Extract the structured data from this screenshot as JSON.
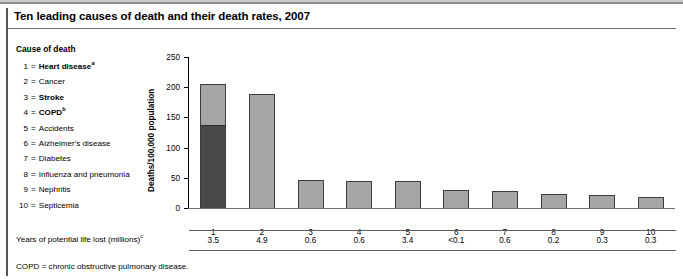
{
  "title": "Ten leading causes of death and their death rates, 2007",
  "legend": {
    "heading": "Cause of death",
    "items": [
      {
        "num": "1",
        "eq": "=",
        "label": "Heart disease",
        "sup": "a",
        "bold": true
      },
      {
        "num": "2",
        "eq": "=",
        "label": "Cancer",
        "sup": "",
        "bold": false
      },
      {
        "num": "3",
        "eq": "=",
        "label": "Stroke",
        "sup": "",
        "bold": true
      },
      {
        "num": "4",
        "eq": "=",
        "label": "COPD",
        "sup": "b",
        "bold": true
      },
      {
        "num": "5",
        "eq": "=",
        "label": "Accidents",
        "sup": "",
        "bold": false
      },
      {
        "num": "6",
        "eq": "=",
        "label": "Alzheimer's disease",
        "sup": "",
        "bold": false
      },
      {
        "num": "7",
        "eq": "=",
        "label": "Diabetes",
        "sup": "",
        "bold": false
      },
      {
        "num": "8",
        "eq": "=",
        "label": "Influenza and pneumonia",
        "sup": "",
        "bold": false
      },
      {
        "num": "9",
        "eq": "=",
        "label": "Nephritis",
        "sup": "",
        "bold": false
      },
      {
        "num": "10",
        "eq": "=",
        "label": "Septicemia",
        "sup": "",
        "bold": false
      }
    ]
  },
  "table": {
    "row_label": "Years of potential life lost (millions)",
    "row_label_sup": "c",
    "values": [
      "3.5",
      "4.9",
      "0.6",
      "0.6",
      "3.4",
      "<0.1",
      "0.6",
      "0.2",
      "0.3",
      "0.3"
    ]
  },
  "footnote": "COPD = chronic obstructive pulmonary disease.",
  "colors": {
    "bar_light": "#a6a6a6",
    "bar_dark": "#4a4a4a",
    "bar_outline": "#3d3d3d",
    "axis": "#000000",
    "rule": "#5e5e5e"
  },
  "chart_data": {
    "type": "bar",
    "title": "Ten leading causes of death and their death rates, 2007",
    "xlabel": "",
    "ylabel": "Deaths/100,000 population",
    "ylim": [
      0,
      250
    ],
    "yticks": [
      0,
      50,
      100,
      150,
      200,
      250
    ],
    "ytick_labels": [
      "0",
      "50",
      "100",
      "150",
      "200",
      "250"
    ],
    "grid": false,
    "legend_position": "left-outside",
    "categories": [
      "1",
      "2",
      "3",
      "4",
      "5",
      "6",
      "7",
      "8",
      "9",
      "10"
    ],
    "category_names": [
      "Heart disease",
      "Cancer",
      "Stroke",
      "COPD",
      "Accidents",
      "Alzheimer's disease",
      "Diabetes",
      "Influenza and pneumonia",
      "Nephritis",
      "Septicemia"
    ],
    "values": [
      205,
      189,
      46,
      45,
      44,
      29,
      28,
      23,
      22,
      19
    ],
    "stacked": true,
    "series": [
      {
        "name": "Lower segment (dark)",
        "color": "#4a4a4a",
        "values": [
          137,
          0,
          0,
          0,
          0,
          0,
          0,
          0,
          0,
          0
        ]
      },
      {
        "name": "Upper segment (light)",
        "color": "#a6a6a6",
        "values": [
          68,
          189,
          46,
          45,
          44,
          29,
          28,
          23,
          22,
          19
        ]
      }
    ],
    "annotations": {
      "years_of_potential_life_lost_millions": [
        "3.5",
        "4.9",
        "0.6",
        "0.6",
        "3.4",
        "<0.1",
        "0.6",
        "0.2",
        "0.3",
        "0.3"
      ]
    }
  }
}
